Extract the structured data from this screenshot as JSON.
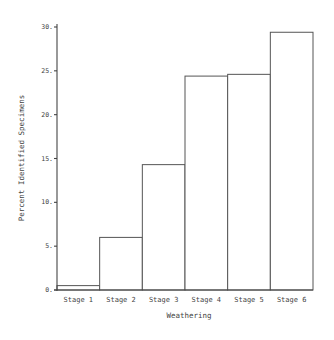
{
  "chart_data": {
    "type": "bar",
    "title": "",
    "xlabel": "Weathering",
    "ylabel": "Percent Identified Specimens",
    "categories": [
      "Stage 1",
      "Stage 2",
      "Stage 3",
      "Stage 4",
      "Stage 5",
      "Stage 6"
    ],
    "values": [
      0.5,
      6.0,
      14.3,
      24.4,
      24.6,
      29.4
    ],
    "ylim": [
      0,
      30
    ],
    "yticks": [
      0,
      5,
      10,
      15,
      20,
      25,
      30
    ],
    "ytick_labels": [
      "0",
      "5",
      "10",
      "15",
      "20",
      "25",
      "30"
    ],
    "grid": false,
    "legend": null,
    "bar_style": "adjacent outlined bars, white fill"
  },
  "colors": {
    "bar_fill": "#ffffff",
    "bar_stroke": "#555555",
    "axis": "#444444",
    "text": "#444444"
  }
}
